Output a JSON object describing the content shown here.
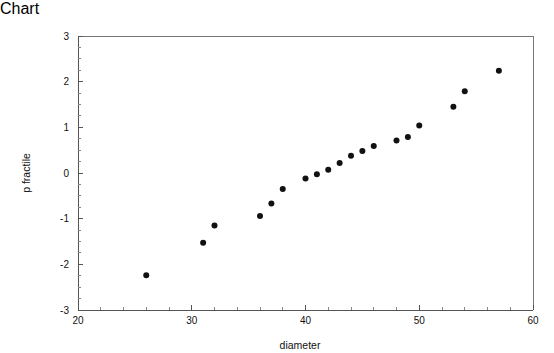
{
  "chart_data": {
    "type": "scatter",
    "title": "",
    "subtitle": "",
    "xlabel": "diameter",
    "ylabel": "p fractile",
    "xlim": [
      20,
      60
    ],
    "ylim": [
      -3,
      3
    ],
    "grid": false,
    "legend": null,
    "x_ticks": [
      20,
      30,
      40,
      50,
      60
    ],
    "x_tick_labels": [
      "20",
      "30",
      "40",
      "50",
      "60"
    ],
    "x_minor_tick_step": 2,
    "y_ticks": [
      -3,
      -2,
      -1,
      0,
      1,
      2,
      3
    ],
    "y_tick_labels": [
      "-3",
      "-2",
      "-1",
      "0",
      "1",
      "2",
      "3"
    ],
    "y_minor_tick_step": 0.25,
    "marker": "filled-circle",
    "marker_color": "#111111",
    "marker_size_px": 3,
    "series": [
      {
        "name": "normal probability plot",
        "x": [
          26,
          31,
          32,
          36,
          37,
          38,
          40,
          41,
          42,
          43,
          44,
          45,
          46,
          48,
          49,
          50,
          53,
          54,
          57
        ],
        "y": [
          -2.24,
          -1.53,
          -1.15,
          -0.94,
          -0.67,
          -0.35,
          -0.12,
          -0.03,
          0.07,
          0.22,
          0.38,
          0.48,
          0.59,
          0.71,
          0.79,
          1.04,
          1.45,
          1.79,
          2.24
        ]
      }
    ],
    "n_points": 19
  },
  "axes": {
    "x_title": "diameter",
    "y_title": "p fractile"
  },
  "colors": {
    "background": "#ffffff",
    "axis": "#555555",
    "frame": "#777777",
    "text": "#111111",
    "marker": "#111111"
  }
}
